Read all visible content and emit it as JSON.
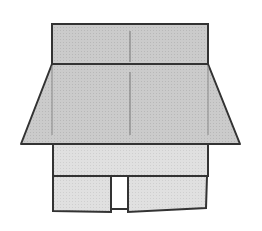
{
  "diagram": {
    "colors": {
      "background": "#ffffff",
      "fill_dark": "#c8c8c8",
      "fill_light": "#dedede",
      "stroke": "#333333",
      "fold_line": "#777777",
      "door_gap": "#ffffff"
    },
    "parts": {
      "top_band": {
        "x": 52,
        "y": 24,
        "w": 156,
        "h": 40
      },
      "roof": {
        "top_left": [
          52,
          64
        ],
        "top_right": [
          208,
          64
        ],
        "bottom_right": [
          240,
          144
        ],
        "bottom_left": [
          21,
          144
        ]
      },
      "wall": {
        "x": 53,
        "y": 144,
        "w": 155,
        "h": 32
      },
      "left_flap": {
        "x": 53,
        "y": 176,
        "w": 58,
        "h": 35
      },
      "right_flap": {
        "x": 128,
        "y": 176,
        "w": 79,
        "h": 35
      },
      "door_gap": {
        "x": 111,
        "y": 176,
        "w": 17,
        "h": 33
      }
    }
  }
}
